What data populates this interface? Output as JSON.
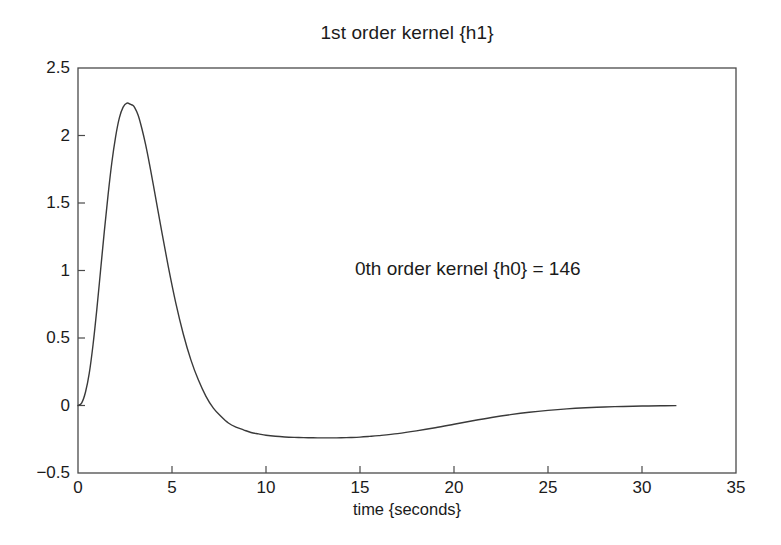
{
  "chart_data": {
    "type": "line",
    "title": "1st order kernel {h1}",
    "xlabel": "time {seconds}",
    "ylabel": "",
    "xlim": [
      0,
      35
    ],
    "ylim": [
      -0.5,
      2.5
    ],
    "xticks": [
      "0",
      "5",
      "10",
      "15",
      "20",
      "25",
      "30",
      "35"
    ],
    "xtick_values": [
      0,
      5,
      10,
      15,
      20,
      25,
      30,
      35
    ],
    "yticks": [
      "-0.5",
      "0",
      "0.5",
      "1",
      "1.5",
      "2",
      "2.5"
    ],
    "ytick_values": [
      -0.5,
      0,
      0.5,
      1,
      1.5,
      2,
      2.5
    ],
    "grid": false,
    "legend": null,
    "line_color": "#3a3a3a",
    "annotations": [
      {
        "text": "0th order kernel {h0} = 146",
        "x": 14.7,
        "y": 1.06
      }
    ],
    "series": [
      {
        "name": "h1",
        "x": [
          0.0,
          0.2,
          0.4,
          0.6,
          0.8,
          1.0,
          1.2,
          1.4,
          1.6,
          1.8,
          2.0,
          2.2,
          2.4,
          2.6,
          2.8,
          2.9,
          3.0,
          3.2,
          3.4,
          3.6,
          3.8,
          4.0,
          4.4,
          4.8,
          5.2,
          5.6,
          6.0,
          6.4,
          6.8,
          7.2,
          7.6,
          8.0,
          8.4,
          8.8,
          9.2,
          9.6,
          10.0,
          10.5,
          11.0,
          11.5,
          12.0,
          12.5,
          13.0,
          13.5,
          14.0,
          14.5,
          15.0,
          15.5,
          16.0,
          17.0,
          18.0,
          19.0,
          20.0,
          21.0,
          22.0,
          23.0,
          24.0,
          25.0,
          26.0,
          27.0,
          28.0,
          29.0,
          30.0,
          31.0,
          31.8
        ],
        "y": [
          0.0,
          0.02,
          0.1,
          0.24,
          0.45,
          0.71,
          1.0,
          1.29,
          1.56,
          1.8,
          1.99,
          2.13,
          2.21,
          2.24,
          2.23,
          2.225,
          2.21,
          2.15,
          2.05,
          1.93,
          1.79,
          1.64,
          1.33,
          1.03,
          0.76,
          0.53,
          0.34,
          0.19,
          0.07,
          -0.02,
          -0.08,
          -0.13,
          -0.16,
          -0.18,
          -0.2,
          -0.21,
          -0.22,
          -0.228,
          -0.233,
          -0.236,
          -0.238,
          -0.239,
          -0.24,
          -0.24,
          -0.239,
          -0.237,
          -0.234,
          -0.229,
          -0.223,
          -0.208,
          -0.188,
          -0.165,
          -0.139,
          -0.113,
          -0.089,
          -0.068,
          -0.05,
          -0.036,
          -0.025,
          -0.017,
          -0.011,
          -0.007,
          -0.004,
          -0.002,
          -0.001
        ]
      }
    ]
  },
  "axes": {
    "box_left_px": 78,
    "box_right_px": 736,
    "box_top_px": 68,
    "box_bottom_px": 473
  }
}
